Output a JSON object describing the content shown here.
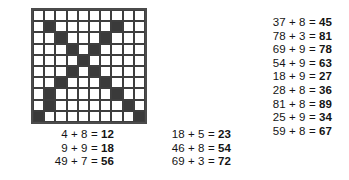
{
  "worksheet": {
    "title": "addition-practice-worksheet",
    "ink_color": "#141414",
    "grid_fill_color": "#3a3a3a",
    "grid_line_color": "#3e3e3e"
  },
  "grid": {
    "name": "x-pattern-grid",
    "rows": 10,
    "cols": 10,
    "pattern": [
      [
        0,
        0,
        0,
        0,
        0,
        0,
        0,
        0,
        0,
        0
      ],
      [
        0,
        1,
        0,
        0,
        0,
        0,
        0,
        1,
        0,
        0
      ],
      [
        0,
        0,
        1,
        0,
        0,
        0,
        1,
        0,
        0,
        0
      ],
      [
        0,
        0,
        0,
        1,
        0,
        1,
        0,
        0,
        0,
        0
      ],
      [
        0,
        0,
        0,
        0,
        1,
        0,
        0,
        0,
        0,
        0
      ],
      [
        0,
        0,
        0,
        1,
        0,
        1,
        0,
        0,
        0,
        0
      ],
      [
        0,
        0,
        1,
        0,
        0,
        0,
        1,
        0,
        0,
        0
      ],
      [
        0,
        1,
        0,
        0,
        0,
        0,
        0,
        1,
        0,
        0
      ],
      [
        0,
        1,
        0,
        0,
        0,
        0,
        0,
        0,
        1,
        0
      ],
      [
        1,
        0,
        0,
        0,
        0,
        0,
        0,
        0,
        0,
        1
      ]
    ]
  },
  "columns": {
    "left": {
      "name": "equations-column-left",
      "equations": [
        {
          "expr": "4 + 8 =",
          "answer": "12"
        },
        {
          "expr": "9 + 9 =",
          "answer": "18"
        },
        {
          "expr": "49 + 7 =",
          "answer": "56"
        }
      ]
    },
    "middle": {
      "name": "equations-column-middle",
      "equations": [
        {
          "expr": "18 + 5 =",
          "answer": "23"
        },
        {
          "expr": "46 + 8 =",
          "answer": "54"
        },
        {
          "expr": "69 + 3 =",
          "answer": "72"
        }
      ]
    },
    "right": {
      "name": "equations-column-right",
      "equations": [
        {
          "expr": "37 + 8 =",
          "answer": "45"
        },
        {
          "expr": "78 + 3 =",
          "answer": "81"
        },
        {
          "expr": "69 + 9 =",
          "answer": "78"
        },
        {
          "expr": "54 + 9 =",
          "answer": "63"
        },
        {
          "expr": "18 + 9 =",
          "answer": "27"
        },
        {
          "expr": "28 + 8 =",
          "answer": "36"
        },
        {
          "expr": "81 + 8 =",
          "answer": "89"
        },
        {
          "expr": "25 + 9 =",
          "answer": "34"
        },
        {
          "expr": "59 + 8 =",
          "answer": "67"
        }
      ]
    }
  }
}
